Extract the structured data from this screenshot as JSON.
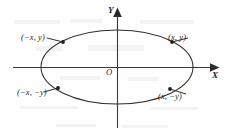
{
  "figure": {
    "kind": "ellipse-symmetry-diagram",
    "width": 227,
    "height": 135,
    "background_color": "#fefefe",
    "ink_color": "#2e2e2e"
  },
  "axes": {
    "x": {
      "label": "X",
      "orientation": "horizontal",
      "y_position": 67,
      "start_x": 13,
      "end_x": 218,
      "arrow": "right"
    },
    "y": {
      "label": "Y",
      "orientation": "vertical",
      "x_position": 117,
      "start_y": 128,
      "end_y": 8,
      "arrow": "up"
    },
    "origin": {
      "label": "O",
      "x": 117,
      "y": 67
    }
  },
  "curve": {
    "type": "ellipse",
    "center_x": 117,
    "center_y": 67,
    "radius_x": 76,
    "radius_y": 37
  },
  "points": [
    {
      "id": "upper-left",
      "label": "(−x, y)",
      "dot_x": 63,
      "dot_y": 42,
      "leader_from_x": 57,
      "leader_from_y": 41,
      "quadrant": "II"
    },
    {
      "id": "upper-right",
      "label": "(x, y)",
      "dot_x": 172,
      "dot_y": 42,
      "leader_from_x": 178,
      "leader_from_y": 41,
      "quadrant": "I"
    },
    {
      "id": "lower-left",
      "label": "(−x, −y)",
      "dot_x": 58,
      "dot_y": 88,
      "leader_from_x": 52,
      "leader_from_y": 90,
      "quadrant": "III"
    },
    {
      "id": "lower-right",
      "label": "(x, −y)",
      "dot_x": 170,
      "dot_y": 89,
      "leader_from_x": 177,
      "leader_from_y": 91,
      "quadrant": "IV"
    }
  ]
}
